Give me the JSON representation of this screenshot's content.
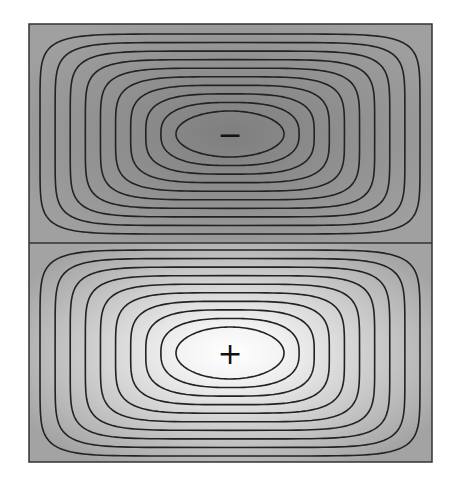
{
  "diagram": {
    "type": "contour",
    "frame": {
      "x": 29,
      "y": 24,
      "width": 403,
      "height": 438,
      "divider_y": 243
    },
    "colors": {
      "background": "#ffffff",
      "frame_stroke": "#333333",
      "contour_stroke": "#222222",
      "top_outer": "#a0a0a0",
      "top_center": "#7f7f7f",
      "bottom_outer": "#a3a3a3",
      "bottom_center": "#ffffff",
      "label": "#111111"
    },
    "halves": [
      {
        "name": "top",
        "sign_label": "−",
        "center": {
          "x": 230,
          "y": 134
        },
        "contour_count": 10,
        "innermost": {
          "rx": 54,
          "ry": 23
        },
        "outermost": {
          "rx": 190,
          "ry": 100
        }
      },
      {
        "name": "bottom",
        "sign_label": "+",
        "center": {
          "x": 230,
          "y": 353
        },
        "contour_count": 10,
        "innermost": {
          "rx": 54,
          "ry": 26
        },
        "outermost": {
          "rx": 190,
          "ry": 103
        }
      }
    ]
  }
}
